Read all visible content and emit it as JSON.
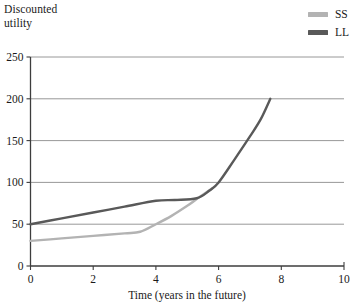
{
  "chart_data": {
    "type": "line",
    "title": "",
    "ylabel": "Discounted\nutility",
    "xlabel": "Time (years in the future)",
    "xlim": [
      0,
      10
    ],
    "ylim": [
      0,
      250
    ],
    "xticks": [
      "0",
      "2",
      "4",
      "6",
      "8",
      "10"
    ],
    "xtick_values": [
      0,
      2,
      4,
      6,
      8,
      10
    ],
    "yticks": [
      "250",
      "200",
      "150",
      "100",
      "50",
      "0"
    ],
    "ytick_values": [
      250,
      200,
      150,
      100,
      50,
      0
    ],
    "grid": "horizontal",
    "legend_position": "top-right",
    "series": [
      {
        "name": "SS",
        "color": "#b3b3b3",
        "points": [
          [
            0.0,
            30
          ],
          [
            1.0,
            33
          ],
          [
            2.0,
            36
          ],
          [
            3.0,
            39
          ],
          [
            3.5,
            41
          ],
          [
            4.0,
            50
          ],
          [
            4.5,
            60
          ],
          [
            5.0,
            72
          ],
          [
            5.3,
            80
          ],
          [
            5.6,
            88
          ],
          [
            5.8,
            93
          ]
        ]
      },
      {
        "name": "LL",
        "color": "#595959",
        "points": [
          [
            0.0,
            50
          ],
          [
            1.0,
            57
          ],
          [
            2.0,
            64
          ],
          [
            3.0,
            71
          ],
          [
            4.0,
            78
          ],
          [
            4.6,
            79
          ],
          [
            5.3,
            81
          ],
          [
            5.7,
            90
          ],
          [
            6.0,
            100
          ],
          [
            6.5,
            127
          ],
          [
            7.0,
            155
          ],
          [
            7.35,
            176
          ],
          [
            7.65,
            200
          ]
        ]
      }
    ]
  },
  "legend": {
    "items": [
      {
        "label": "SS",
        "color": "#b3b3b3"
      },
      {
        "label": "LL",
        "color": "#595959"
      }
    ]
  },
  "axes": {
    "y_title": "Discounted\nutility",
    "x_title": "Time (years in the future)"
  },
  "colors": {
    "axis": "#3d3d3d",
    "gridline": "#8c8c8c",
    "background": "#ffffff",
    "text": "#1a1a1a",
    "ss": "#b3b3b3",
    "ll": "#595959"
  }
}
